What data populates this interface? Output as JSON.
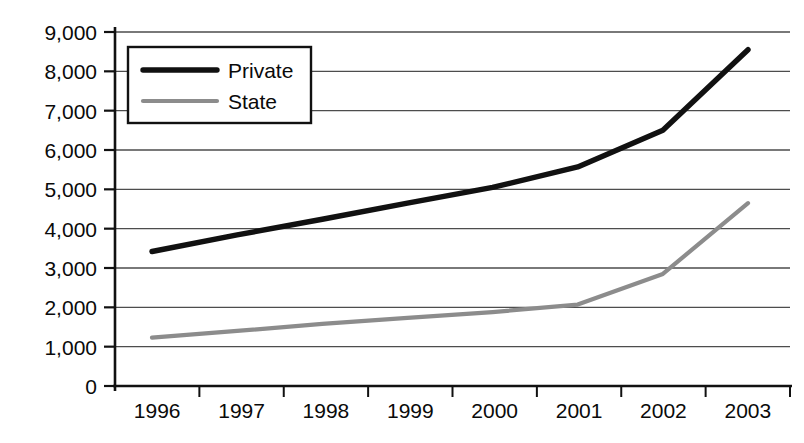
{
  "chart_data": {
    "type": "line",
    "title": "",
    "subtitle": "",
    "xlabel": "",
    "ylabel": "",
    "categories": [
      "1996",
      "1997",
      "1998",
      "1999",
      "2000",
      "2001",
      "2002",
      "2003"
    ],
    "x": [
      1996,
      1997,
      1998,
      1999,
      2000,
      2001,
      2002,
      2003
    ],
    "series": [
      {
        "name": "Private",
        "color": "#111111",
        "values": [
          3420,
          3840,
          4240,
          4650,
          5050,
          5570,
          6500,
          8550
        ]
      },
      {
        "name": "State",
        "color": "#8c8c8c",
        "values": [
          1230,
          1400,
          1580,
          1730,
          1880,
          2070,
          2850,
          4650
        ]
      }
    ],
    "ylim": [
      0,
      9000
    ],
    "ytick_values": [
      0,
      1000,
      2000,
      3000,
      4000,
      5000,
      6000,
      7000,
      8000,
      9000
    ],
    "ytick_labels": [
      "0",
      "1,000",
      "2,000",
      "3,000",
      "4,000",
      "5,000",
      "6,000",
      "7,000",
      "8,000",
      "9,000"
    ],
    "grid": true,
    "grid_axis": "y",
    "legend_position": "top-left-inside",
    "legend_entries": [
      "Private",
      "State"
    ]
  },
  "axes": {
    "y_labels": [
      "9,000",
      "8,000",
      "7,000",
      "6,000",
      "5,000",
      "4,000",
      "3,000",
      "2,000",
      "1,000",
      "0"
    ],
    "x_labels": [
      "1996",
      "1997",
      "1998",
      "1999",
      "2000",
      "2001",
      "2002",
      "2003"
    ]
  },
  "legend": {
    "series_1_label": "Private",
    "series_2_label": "State"
  },
  "caption": {
    "text": ""
  },
  "colors": {
    "private_line": "#111111",
    "state_line": "#8c8c8c",
    "grid": "#4d4d4d",
    "axis": "#111111",
    "background": "#ffffff"
  }
}
